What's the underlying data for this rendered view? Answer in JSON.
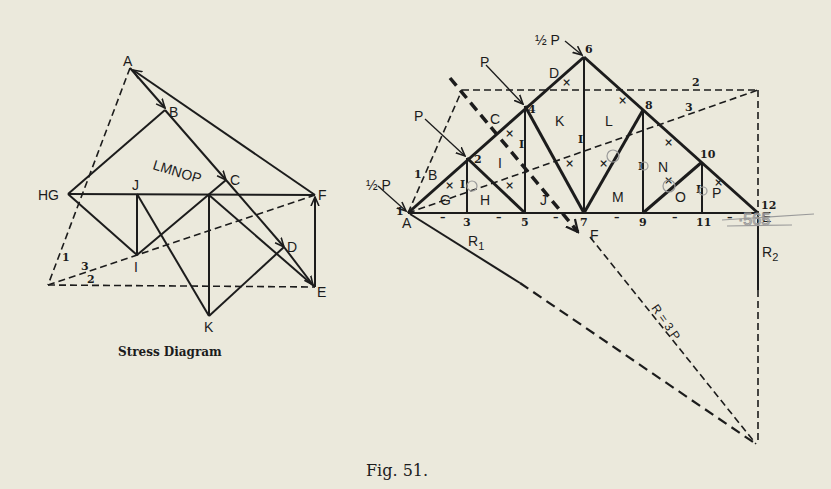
{
  "figure": {
    "caption": "Fig. 51.",
    "stress_diagram_title": "Stress Diagram"
  },
  "stress_diagram": {
    "labels": {
      "A": "A",
      "B": "B",
      "C": "C",
      "D": "D",
      "E": "E",
      "F": "F",
      "HG": "HG",
      "J": "J",
      "I": "I",
      "K": "K",
      "LMNOP": "LMNOP",
      "ray1": "1",
      "ray2": "2",
      "ray3": "3"
    }
  },
  "truss": {
    "loads": {
      "half_p_left": "½ P",
      "p1": "P",
      "p2": "P",
      "half_p_top": "½ P"
    },
    "joints": [
      "1",
      "2",
      "3",
      "4",
      "5",
      "6",
      "7",
      "8",
      "9",
      "10",
      "11",
      "12"
    ],
    "panels": {
      "A": "A",
      "B": "B",
      "C": "C",
      "D": "D",
      "E": "E",
      "F": "F",
      "G": "G",
      "H": "H",
      "I": "I",
      "J": "J",
      "K": "K",
      "L": "L",
      "M": "M",
      "N": "N",
      "O": "O",
      "P": "P"
    },
    "reactions": {
      "R1": "R",
      "R1_sub": "1",
      "R2": "R",
      "R2_sub": "2",
      "resultant": "R = 3 P"
    },
    "funicular_rays": {
      "r1": "1",
      "r2": "2",
      "r3": "3"
    },
    "member_marks": {
      "compression": "×",
      "tension": "I",
      "chord": "–"
    },
    "pencil_note": "·565"
  },
  "colors": {
    "paper": "#ebe9dc",
    "ink": "#1c1c1c",
    "pencil": "#9a9a9a"
  }
}
